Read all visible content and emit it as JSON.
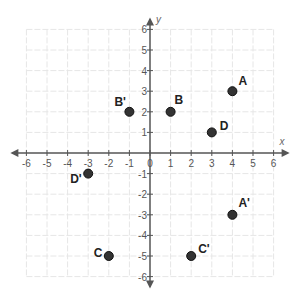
{
  "chart_data": {
    "type": "scatter",
    "title": "",
    "xlabel": "x",
    "ylabel": "y",
    "xlim": [
      -6,
      6
    ],
    "ylim": [
      -6,
      6
    ],
    "grid": true,
    "x_ticks": [
      -6,
      -5,
      -4,
      -3,
      -2,
      -1,
      0,
      1,
      2,
      3,
      4,
      5,
      6
    ],
    "y_ticks": [
      -6,
      -5,
      -4,
      -3,
      -2,
      -1,
      1,
      2,
      3,
      4,
      5,
      6
    ],
    "points": [
      {
        "label": "A",
        "x": 4,
        "y": 3,
        "label_dx": 6,
        "label_dy": -6
      },
      {
        "label": "B",
        "x": 1,
        "y": 2,
        "label_dx": 4,
        "label_dy": -8
      },
      {
        "label": "B'",
        "x": -1,
        "y": 2,
        "label_dx": -15,
        "label_dy": -6
      },
      {
        "label": "D",
        "x": 3,
        "y": 1,
        "label_dx": 8,
        "label_dy": -2
      },
      {
        "label": "D'",
        "x": -3,
        "y": -1,
        "label_dx": -18,
        "label_dy": 9
      },
      {
        "label": "A'",
        "x": 4,
        "y": -3,
        "label_dx": 6,
        "label_dy": -8
      },
      {
        "label": "C",
        "x": -2,
        "y": -5,
        "label_dx": -15,
        "label_dy": 1
      },
      {
        "label": "C'",
        "x": 2,
        "y": -5,
        "label_dx": 7,
        "label_dy": -3
      }
    ]
  },
  "style": {
    "axis_color": "#555555",
    "grid_color": "#e6e6e6",
    "point_fill": "#333333",
    "point_stroke": "#111111"
  },
  "layout": {
    "origin_x": 150,
    "origin_y": 153,
    "unit": 20.6
  }
}
